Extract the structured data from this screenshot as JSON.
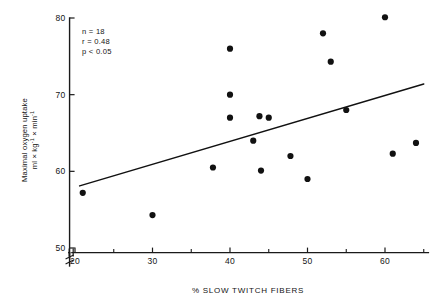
{
  "chart_data": {
    "type": "scatter",
    "title": "",
    "xlabel": "% SLOW TWITCH FIBERS",
    "ylabel_line1": "Maximal oxygen uptake",
    "ylabel_line2_prefix": "ml × kg",
    "ylabel_line2_sup1": "-1",
    "ylabel_line2_mid": " × min",
    "ylabel_line2_sup2": "-1",
    "xlim": [
      18,
      66
    ],
    "ylim": [
      48.5,
      81
    ],
    "grid": false,
    "legend": "none",
    "axis_break_x": true,
    "axis_break_y": true,
    "xticks": [
      20,
      30,
      40,
      50,
      60
    ],
    "xtick_labels": [
      "20",
      "30",
      "40",
      "50",
      "60"
    ],
    "xticks_minor": [
      25,
      35,
      45,
      55,
      65
    ],
    "yticks": [
      50,
      60,
      70,
      80
    ],
    "ytick_labels": [
      "50",
      "60",
      "70",
      "80"
    ],
    "points": [
      {
        "x": 21.0,
        "y": 57.2
      },
      {
        "x": 30.0,
        "y": 54.3
      },
      {
        "x": 37.8,
        "y": 60.5
      },
      {
        "x": 40.0,
        "y": 76.0
      },
      {
        "x": 40.0,
        "y": 70.0
      },
      {
        "x": 40.0,
        "y": 67.0
      },
      {
        "x": 43.0,
        "y": 64.0
      },
      {
        "x": 43.8,
        "y": 67.2
      },
      {
        "x": 45.0,
        "y": 67.0
      },
      {
        "x": 44.0,
        "y": 60.1
      },
      {
        "x": 47.8,
        "y": 62.0
      },
      {
        "x": 50.0,
        "y": 59.0
      },
      {
        "x": 52.0,
        "y": 78.0
      },
      {
        "x": 53.0,
        "y": 74.3
      },
      {
        "x": 55.0,
        "y": 68.0
      },
      {
        "x": 60.0,
        "y": 80.1
      },
      {
        "x": 61.0,
        "y": 62.3
      },
      {
        "x": 64.0,
        "y": 63.7
      }
    ],
    "trend_line": {
      "x_start": 20.6,
      "y_start": 58.1,
      "x_end": 65.0,
      "y_end": 71.4
    },
    "annotations": {
      "n": "n = 18",
      "r": "r = 0.48",
      "p": "p < 0.05"
    },
    "colors": {
      "point": "#111111",
      "line": "#111111",
      "axis": "#1a1a1a",
      "background": "#ffffff"
    }
  }
}
